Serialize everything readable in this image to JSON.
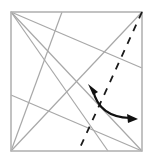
{
  "figure": {
    "type": "origami-diagram",
    "background_color": "#ffffff",
    "width": 155,
    "height": 160
  },
  "colors": {
    "paper_edge": "#b3b3b3",
    "crease_line": "#a8a8a8",
    "fold_line_dashed": "#1a1a1a",
    "arrow": "#111111",
    "paper_fill": "#ffffff"
  },
  "paper": {
    "name": "square-sheet",
    "edge_color": "#b3b3b3",
    "stroke_width": 1.6,
    "corners": {
      "top_left": [
        11,
        12
      ],
      "top_right": [
        142,
        12
      ],
      "bottom_right": [
        142,
        151
      ],
      "bottom_left": [
        11,
        151
      ]
    }
  },
  "crease_lines": [
    {
      "name": "crease-tl-to-bottom-right-corner",
      "from": [
        11,
        12
      ],
      "to": [
        142,
        151
      ],
      "style": "solid",
      "color": "#a8a8a8",
      "width": 1.2
    },
    {
      "name": "crease-tl-to-bottom-edge",
      "from": [
        11,
        12
      ],
      "to": [
        108,
        151
      ],
      "style": "solid",
      "color": "#a8a8a8",
      "width": 1.2
    },
    {
      "name": "crease-tl-to-right-edge",
      "from": [
        11,
        12
      ],
      "to": [
        142,
        68
      ],
      "style": "solid",
      "color": "#a8a8a8",
      "width": 1.2
    },
    {
      "name": "crease-bl-to-top-right-corner",
      "from": [
        11,
        151
      ],
      "to": [
        142,
        12
      ],
      "style": "solid",
      "color": "#a8a8a8",
      "width": 1.2
    },
    {
      "name": "crease-bl-to-top-edge",
      "from": [
        11,
        151
      ],
      "to": [
        62,
        12
      ],
      "style": "solid",
      "color": "#a8a8a8",
      "width": 1.2
    },
    {
      "name": "crease-bl-to-right-edge",
      "from": [
        11,
        151
      ],
      "to": [
        142,
        151
      ],
      "style": "solid",
      "color": "#a8a8a8",
      "width": 1.2
    },
    {
      "name": "crease-left-edge-to-bottom-right-corner",
      "from": [
        11,
        95
      ],
      "to": [
        142,
        151
      ],
      "style": "solid",
      "color": "#a8a8a8",
      "width": 1.2
    }
  ],
  "fold_lines": [
    {
      "name": "fold-line-dashed-diagonal",
      "from": [
        142,
        12
      ],
      "to": [
        78,
        152
      ],
      "style": "dashed",
      "dash_pattern": "7 7",
      "color": "#1a1a1a",
      "width": 1.8,
      "meaning": "valley-fold"
    }
  ],
  "arrows": [
    {
      "name": "fold-direction-double-arrow",
      "type": "double-headed-curved",
      "color": "#111111",
      "width": 2.2,
      "path": "M 92 88 Q 100 118 133 118",
      "head_start": [
        92,
        88
      ],
      "head_end": [
        133,
        118
      ],
      "meaning": "fold and unfold across dashed line"
    }
  ],
  "labels": []
}
